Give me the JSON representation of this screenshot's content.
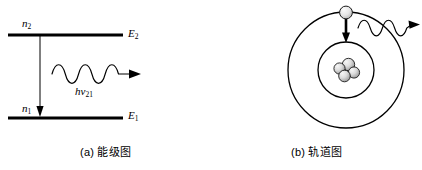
{
  "figure": {
    "background_color": "#ffffff",
    "line_color": "#000000",
    "width": 422,
    "height": 170
  },
  "panel_a": {
    "caption": "(a) 能级图",
    "labels": {
      "upper_population": "n",
      "upper_population_sub": "2",
      "lower_population": "n",
      "lower_population_sub": "1",
      "upper_energy": "E",
      "upper_energy_sub": "2",
      "lower_energy": "E",
      "lower_energy_sub": "1",
      "photon": "hν",
      "photon_sub": "21"
    },
    "levels": [
      {
        "name": "upper-level",
        "energy_label": "E2",
        "population_label": "n2",
        "y": 35
      },
      {
        "name": "lower-level",
        "energy_label": "E1",
        "population_label": "n1",
        "y": 118
      }
    ],
    "transition": {
      "name": "downward-transition-arrow",
      "from_level": "E2",
      "to_level": "E1",
      "direction": "down"
    },
    "emitted_wave": {
      "name": "emitted-photon-wave",
      "cycles": 4,
      "direction": "right"
    }
  },
  "panel_b": {
    "caption": "(b) 轨道图",
    "orbits": [
      {
        "name": "outer-orbit",
        "radius": 58
      },
      {
        "name": "inner-orbit",
        "radius": 28
      }
    ],
    "nucleus": {
      "name": "nucleus",
      "particle_count": 4,
      "fill_color": "#d8d8d8"
    },
    "electron": {
      "name": "electron",
      "fill_color": "#e8e8e8",
      "position": "top-of-outer-orbit"
    },
    "transition": {
      "name": "electron-drop-arrow",
      "direction": "down"
    },
    "emitted_wave": {
      "name": "emitted-photon-wave",
      "cycles": 4,
      "direction": "right"
    }
  }
}
